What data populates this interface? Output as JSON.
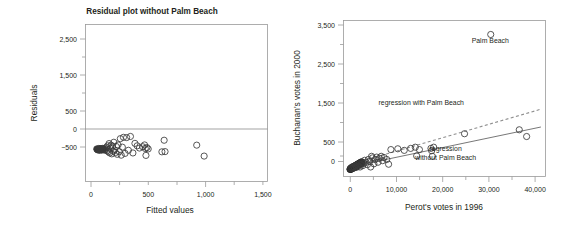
{
  "figure": {
    "background": "#ffffff",
    "text_color": "#231f20"
  },
  "chart_data": [
    {
      "id": "residual-plot",
      "type": "scatter",
      "title": "Residual plot without Palm Beach",
      "xlabel": "Fitted values",
      "ylabel": "Residuals",
      "xlim": [
        -60,
        1560
      ],
      "ylim": [
        -760,
        2760
      ],
      "xticks": [
        0,
        500,
        1000,
        1500
      ],
      "xticklabels": [
        "0",
        "500",
        "1,000",
        "1,500"
      ],
      "xminorticks": [
        250,
        750,
        1250
      ],
      "yticks": [
        -500,
        0,
        500,
        1500,
        2500
      ],
      "yticklabels": [
        "−500",
        "0",
        "500",
        "1,500",
        "2,500"
      ],
      "yminorticks": [
        1000,
        2000
      ],
      "grid": false,
      "legend": "none",
      "reference_line": {
        "orientation": "horizontal",
        "y": 0,
        "color": "#7d7d7d"
      },
      "marker": {
        "shape": "circle",
        "filled": false,
        "color": "#3a3a3a",
        "radius_px": 3.1
      },
      "points": [
        [
          40,
          -30
        ],
        [
          46,
          -42
        ],
        [
          52,
          -55
        ],
        [
          58,
          -20
        ],
        [
          62,
          -48
        ],
        [
          66,
          -35
        ],
        [
          70,
          -60
        ],
        [
          74,
          -25
        ],
        [
          78,
          -44
        ],
        [
          82,
          -38
        ],
        [
          86,
          -52
        ],
        [
          90,
          -18
        ],
        [
          96,
          -40
        ],
        [
          102,
          -30
        ],
        [
          108,
          -58
        ],
        [
          114,
          -22
        ],
        [
          120,
          -46
        ],
        [
          126,
          10
        ],
        [
          132,
          -70
        ],
        [
          138,
          40
        ],
        [
          144,
          -95
        ],
        [
          150,
          90
        ],
        [
          156,
          -120
        ],
        [
          162,
          -15
        ],
        [
          168,
          55
        ],
        [
          174,
          -140
        ],
        [
          180,
          30
        ],
        [
          186,
          -80
        ],
        [
          192,
          120
        ],
        [
          198,
          -55
        ],
        [
          206,
          -110
        ],
        [
          214,
          25
        ],
        [
          222,
          -150
        ],
        [
          230,
          60
        ],
        [
          240,
          -90
        ],
        [
          250,
          200
        ],
        [
          258,
          -170
        ],
        [
          268,
          10
        ],
        [
          278,
          230
        ],
        [
          292,
          -130
        ],
        [
          306,
          225
        ],
        [
          322,
          -60
        ],
        [
          340,
          250
        ],
        [
          362,
          -120
        ],
        [
          380,
          95
        ],
        [
          400,
          40
        ],
        [
          420,
          -10
        ],
        [
          448,
          20
        ],
        [
          466,
          60
        ],
        [
          472,
          -20
        ],
        [
          478,
          -175
        ],
        [
          486,
          0
        ],
        [
          498,
          -30
        ],
        [
          620,
          -95
        ],
        [
          640,
          165
        ],
        [
          648,
          -90
        ],
        [
          930,
          55
        ],
        [
          996,
          -190
        ]
      ],
      "dense_cluster": {
        "note": "overplotted near-origin residuals drawn as filled marks",
        "points": [
          [
            44,
            -38
          ],
          [
            50,
            -44
          ],
          [
            56,
            -36
          ],
          [
            62,
            -50
          ],
          [
            68,
            -30
          ],
          [
            74,
            -42
          ],
          [
            80,
            -35
          ],
          [
            86,
            -48
          ],
          [
            92,
            -28
          ],
          [
            98,
            -40
          ]
        ]
      }
    },
    {
      "id": "buchanan-perot-scatter",
      "type": "scatter",
      "title": "",
      "xlabel": "Perot's votes in 1996",
      "ylabel": "Buchanan's votes in 2000",
      "xlim": [
        -1400,
        42500
      ],
      "ylim": [
        -180,
        3760
      ],
      "xticks": [
        0,
        10000,
        20000,
        30000,
        40000
      ],
      "xticklabels": [
        "0",
        "10,000",
        "20,000",
        "30,000",
        "40,000"
      ],
      "xminorticks": [
        5000,
        15000,
        25000,
        35000
      ],
      "yticks": [
        0,
        500,
        1500,
        2500,
        3500
      ],
      "yticklabels": [
        "0",
        "500",
        "1,500",
        "2,500",
        "3,500"
      ],
      "yminorticks": [
        1000,
        2000,
        3000
      ],
      "grid": false,
      "legend": "inline-annotations",
      "marker": {
        "shape": "circle",
        "filled": false,
        "color": "#3a3a3a",
        "radius_px": 3.1
      },
      "annotations": [
        {
          "name": "palm-beach-label",
          "text": "Palm Beach",
          "x": 30500,
          "y": 3180
        },
        {
          "name": "regression-with-label",
          "text": "regression with Palm Beach",
          "x": 15500,
          "y": 1620
        },
        {
          "name": "regression-without-label-line1",
          "text": "regression",
          "x": 20800,
          "y": 470
        },
        {
          "name": "regression-without-label-line2",
          "text": "without Palm Beach",
          "x": 20800,
          "y": 230
        }
      ],
      "series": [
        {
          "name": "counties",
          "points": [
            [
              30600,
              3407
            ],
            [
              38400,
              830
            ],
            [
              36800,
              1000
            ],
            [
              24900,
              900
            ],
            [
              18200,
              560
            ],
            [
              17600,
              530
            ],
            [
              17900,
              330
            ],
            [
              17750,
              470
            ],
            [
              15100,
              500
            ],
            [
              14200,
              560
            ],
            [
              14500,
              340
            ],
            [
              13200,
              530
            ],
            [
              11800,
              480
            ],
            [
              10400,
              520
            ],
            [
              8900,
              500
            ],
            [
              8400,
              130
            ],
            [
              8000,
              250
            ],
            [
              7400,
              300
            ],
            [
              7100,
              220
            ],
            [
              6800,
              330
            ],
            [
              6400,
              280
            ],
            [
              6100,
              180
            ],
            [
              5800,
              310
            ],
            [
              5500,
              250
            ],
            [
              5200,
              140
            ],
            [
              4900,
              290
            ],
            [
              4700,
              330
            ],
            [
              4500,
              60
            ],
            [
              4300,
              200
            ],
            [
              4000,
              250
            ],
            [
              3800,
              120
            ],
            [
              3500,
              180
            ],
            [
              3200,
              230
            ],
            [
              3000,
              150
            ],
            [
              2800,
              95
            ],
            [
              2600,
              170
            ],
            [
              2400,
              120
            ],
            [
              2200,
              60
            ],
            [
              2000,
              140
            ],
            [
              1800,
              80
            ],
            [
              1600,
              110
            ],
            [
              1400,
              50
            ],
            [
              1200,
              90
            ],
            [
              1000,
              40
            ],
            [
              800,
              70
            ],
            [
              600,
              30
            ],
            [
              400,
              55
            ],
            [
              200,
              20
            ]
          ]
        }
      ],
      "dense_cluster": {
        "note": "heavily overplotted low-vote counties near the origin drawn solid black",
        "x_range": [
          0,
          2600
        ],
        "y_range": [
          0,
          180
        ]
      },
      "regression_lines": [
        {
          "name": "regression with Palm Beach",
          "style": "dashed",
          "color": "#8f8f8f",
          "endpoints": [
            [
              0,
              120
            ],
            [
              41500,
              1520
            ]
          ]
        },
        {
          "name": "regression without Palm Beach",
          "style": "solid",
          "color": "#5f5f5f",
          "endpoints": [
            [
              0,
              60
            ],
            [
              41500,
              1070
            ]
          ]
        }
      ]
    }
  ]
}
